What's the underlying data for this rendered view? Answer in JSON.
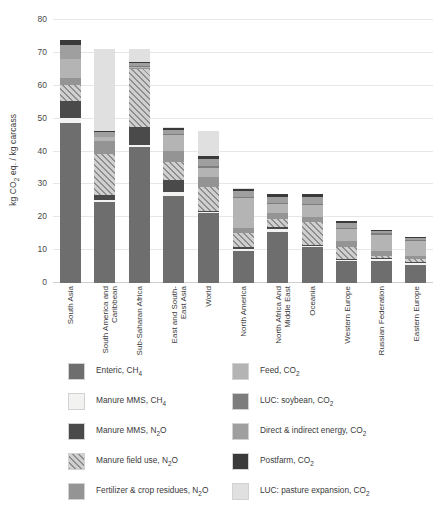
{
  "chart_data": {
    "type": "bar",
    "subtype": "stacked-bar",
    "title": "",
    "xlabel": "",
    "ylabel": "kg CO2 eq. / kg carcass",
    "ylabel_rich": "kg CO₂ eq. / kg carcass",
    "ylim": [
      0,
      80
    ],
    "yticks": [
      0,
      10,
      20,
      30,
      40,
      50,
      60,
      70,
      80
    ],
    "ytick_labels": [
      "0",
      "10",
      "20",
      "30",
      "40",
      "50",
      "60",
      "70",
      "80"
    ],
    "grid": true,
    "grid_axis": "y",
    "legend_position": "below-plot",
    "legend_columns": 2,
    "categories": [
      "South Asia",
      "South America and Caribbean",
      "Sub-Saharan Africa",
      "East and South-East Asia",
      "World",
      "North America",
      "North Africa And Middle East",
      "Oceania",
      "Western Europe",
      "Russian Federation",
      "Eastern Europe"
    ],
    "series": [
      {
        "name": "Enteric, CH4",
        "color": "#6e6e6e",
        "pattern": "solid",
        "values": [
          48.7,
          24.5,
          41.5,
          26.6,
          21.2,
          9.8,
          15.4,
          11.0,
          6.6,
          6.8,
          5.6
        ]
      },
      {
        "name": "Manure MMS, CH4",
        "color": "#f2f2f0",
        "pattern": "solid",
        "values": [
          1.5,
          0.7,
          0.5,
          1.0,
          0.3,
          0.5,
          1.0,
          0.3,
          0.3,
          0.4,
          0.4
        ]
      },
      {
        "name": "Manure MMS, N2O",
        "color": "#4a4a4a",
        "pattern": "solid",
        "values": [
          5.3,
          1.7,
          5.4,
          3.7,
          0.3,
          0.8,
          0.6,
          0.4,
          0.3,
          0.5,
          0.4
        ]
      },
      {
        "name": "Manure field use, N2O",
        "color": "#cfcfcf",
        "pattern": "hatch",
        "values": [
          4.6,
          12.4,
          17.7,
          5.6,
          7.3,
          4.2,
          2.4,
          6.9,
          3.9,
          0.5,
          0.8
        ]
      },
      {
        "name": "Fertilizer & crop residues, N2O",
        "color": "#949494",
        "pattern": "solid",
        "values": [
          2.4,
          4.0,
          0.3,
          3.2,
          3.3,
          1.4,
          1.8,
          1.5,
          1.6,
          1.5,
          1.0
        ]
      },
      {
        "name": "Feed, CO2",
        "color": "#b4b4b4",
        "pattern": "solid",
        "values": [
          5.7,
          1.0,
          0.4,
          4.9,
          2.6,
          9.1,
          2.7,
          3.7,
          3.6,
          5.0,
          4.5
        ]
      },
      {
        "name": "LUC: soybean, CO2",
        "color": "#7d7d7d",
        "pattern": "solid",
        "values": [
          0.0,
          0.2,
          0.1,
          0.3,
          0.6,
          0.4,
          0.4,
          0.3,
          0.5,
          0.6,
          0.4
        ]
      },
      {
        "name": "Direct & indirect energy, CO2",
        "color": "#9f9f9f",
        "pattern": "solid",
        "values": [
          4.3,
          1.4,
          1.0,
          1.4,
          2.2,
          1.8,
          1.9,
          2.0,
          1.6,
          0.6,
          0.7
        ]
      },
      {
        "name": "Postfarm, CO2",
        "color": "#3a3a3a",
        "pattern": "solid",
        "values": [
          1.5,
          0.5,
          0.4,
          0.6,
          0.9,
          0.6,
          0.8,
          0.9,
          0.6,
          0.2,
          0.2
        ]
      },
      {
        "name": "LUC: pasture expansion, CO2",
        "color": "#e0e0e0",
        "pattern": "solid",
        "values": [
          0.0,
          24.8,
          3.9,
          0.1,
          7.5,
          0.2,
          0.1,
          0.2,
          0.0,
          0.0,
          0.0
        ]
      }
    ],
    "totals": [
      74.0,
      71.2,
      71.2,
      47.4,
      46.2,
      28.8,
      27.1,
      27.2,
      19.0,
      16.1,
      14.0
    ]
  },
  "legend": {
    "left": [
      {
        "label": "Enteric, CH",
        "sub": "4",
        "swatch": "#6e6e6e",
        "pattern": "solid"
      },
      {
        "label": "Manure MMS, CH",
        "sub": "4",
        "swatch": "#f2f2f0",
        "pattern": "solid"
      },
      {
        "label": "Manure MMS, N",
        "sub": "2",
        "tail": "O",
        "swatch": "#4a4a4a",
        "pattern": "solid"
      },
      {
        "label": "Manure field use, N",
        "sub": "2",
        "tail": "O",
        "swatch": "#cfcfcf",
        "pattern": "hatch"
      },
      {
        "label": "Fertilizer & crop residues, N",
        "sub": "2",
        "tail": "O",
        "swatch": "#949494",
        "pattern": "solid"
      }
    ],
    "right": [
      {
        "label": "Feed, CO",
        "sub": "2",
        "swatch": "#b4b4b4",
        "pattern": "solid"
      },
      {
        "label": "LUC: soybean, CO",
        "sub": "2",
        "swatch": "#7d7d7d",
        "pattern": "solid"
      },
      {
        "label": "Direct & indirect energy, CO",
        "sub": "2",
        "swatch": "#9f9f9f",
        "pattern": "solid"
      },
      {
        "label": "Postfarm, CO",
        "sub": "2",
        "swatch": "#3a3a3a",
        "pattern": "solid"
      },
      {
        "label": "LUC: pasture expansion, CO",
        "sub": "2",
        "swatch": "#e0e0e0",
        "pattern": "solid"
      }
    ]
  },
  "axis": {
    "ylabel_prefix": "kg CO",
    "ylabel_sub": "2",
    "ylabel_suffix": " eq. / kg carcass"
  }
}
